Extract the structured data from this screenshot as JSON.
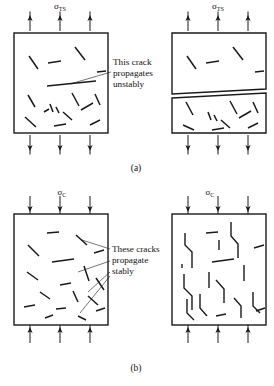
{
  "figure": {
    "background_color": "#ffffff",
    "line_color": "#1a1a1a"
  },
  "panels": [
    {
      "id": "a",
      "caption": "(a)",
      "caption_x": 136,
      "caption_y": 171,
      "stress_symbol": "σ",
      "stress_subscript": "TS",
      "stress_meaning": "tensile-stress",
      "load_direction": "tension",
      "specimens": [
        {
          "role": "before",
          "box": {
            "x": 14,
            "y": 33,
            "w": 94,
            "h": 100
          },
          "arrows_top": [
            30,
            60,
            90
          ],
          "arrows_bottom": [
            30,
            60,
            90
          ],
          "label_x": 60,
          "label_y": 9,
          "cracks": [
            [
              48,
              63,
              61,
              61
            ],
            [
              75,
              47,
              85,
              60
            ],
            [
              29,
              56,
              38,
              69
            ],
            [
              97,
              72,
              106,
              71
            ],
            [
              28,
              95,
              35,
              107
            ],
            [
              72,
              93,
              79,
              106
            ],
            [
              95,
              94,
              100,
              105
            ],
            [
              56,
              107,
              59,
              113
            ],
            [
              50,
              104,
              53,
              112
            ],
            [
              63,
              112,
              72,
              120
            ],
            [
              81,
              110,
              93,
              103
            ],
            [
              25,
              117,
              36,
              127
            ],
            [
              54,
              126,
              66,
              124
            ],
            [
              90,
              125,
              100,
              120
            ],
            [
              44,
              112,
              49,
              109
            ]
          ],
          "critical_crack": [
            47,
            86,
            96,
            81
          ]
        },
        {
          "role": "after",
          "box": {
            "x": 172,
            "y": 33,
            "w": 94,
            "h": 100
          },
          "arrows_top": [
            188,
            218,
            248
          ],
          "arrows_bottom": [
            188,
            218,
            248
          ],
          "label_x": 218,
          "label_y": 9,
          "fracture_path": [
            [
              172,
              96
            ],
            [
              266,
              91
            ]
          ],
          "fracture_gap": 4,
          "cracks": [
            [
              206,
              63,
              219,
              61
            ],
            [
              233,
              47,
              243,
              60
            ],
            [
              187,
              56,
              196,
              69
            ],
            [
              255,
              72,
              264,
              71
            ],
            [
              186,
              102,
              193,
              115
            ],
            [
              230,
              101,
              237,
              114
            ],
            [
              253,
              102,
              258,
              113
            ],
            [
              214,
              115,
              217,
              121
            ],
            [
              208,
              112,
              211,
              120
            ],
            [
              221,
              120,
              230,
              128
            ],
            [
              239,
              118,
              251,
              111
            ],
            [
              183,
              125,
              194,
              130
            ],
            [
              212,
              130,
              224,
              128
            ],
            [
              248,
              128,
              258,
              123
            ]
          ]
        }
      ],
      "annotation": {
        "lines": [
          "This crack",
          "propagates",
          "unstably"
        ],
        "x": 113,
        "y": 65,
        "line_height": 11,
        "leader_from": [
          111,
          72
        ],
        "leader_to": [
          70,
          84
        ]
      }
    },
    {
      "id": "b",
      "caption": "(b)",
      "caption_x": 136,
      "caption_y": 371,
      "stress_symbol": "σ",
      "stress_subscript": "C",
      "stress_meaning": "compressive-stress",
      "load_direction": "compression",
      "specimens": [
        {
          "role": "before",
          "box": {
            "x": 14,
            "y": 214,
            "w": 94,
            "h": 111
          },
          "arrows_top": [
            30,
            60,
            90
          ],
          "arrows_bottom": [
            30,
            60,
            90
          ],
          "label_x": 62,
          "label_y": 195,
          "cracks": [
            [
              47,
              233,
              59,
              232
            ],
            [
              76,
              235,
              87,
              245
            ],
            [
              28,
              245,
              39,
              256
            ],
            [
              94,
              253,
              104,
              250
            ],
            [
              52,
              262,
              74,
              259
            ],
            [
              84,
              266,
              89,
              281
            ],
            [
              27,
              272,
              38,
              280
            ],
            [
              60,
              285,
              71,
              283
            ],
            [
              96,
              278,
              104,
              290
            ],
            [
              40,
              292,
              50,
              299
            ],
            [
              73,
              291,
              78,
              302
            ],
            [
              88,
              296,
              98,
              305
            ],
            [
              24,
              307,
              35,
              305
            ],
            [
              56,
              309,
              66,
              308
            ],
            [
              96,
              311,
              105,
              308
            ],
            [
              45,
              318,
              53,
              315
            ],
            [
              78,
              316,
              86,
              320
            ]
          ]
        },
        {
          "role": "after",
          "box": {
            "x": 172,
            "y": 214,
            "w": 94,
            "h": 111
          },
          "arrows_top": [
            188,
            218,
            248
          ],
          "arrows_bottom": [
            188,
            218,
            248
          ],
          "label_x": 210,
          "label_y": 195,
          "branched_cracks": [
            [
              [
                185,
                233
              ],
              [
                185,
                245
              ],
              [
                192,
                252
              ],
              [
                192,
                268
              ]
            ],
            [
              [
                206,
                233
              ],
              [
                218,
                232
              ]
            ],
            [
              [
                231,
                222
              ],
              [
                231,
                236
              ],
              [
                238,
                244
              ],
              [
                238,
                258
              ]
            ],
            [
              [
                254,
                248
              ],
              [
                264,
                245
              ]
            ],
            [
              [
                182,
                264
              ],
              [
                182,
                268
              ]
            ],
            [
              [
                184,
                274
              ],
              [
                184,
                288
              ],
              [
                192,
                296
              ],
              [
                192,
                310
              ]
            ],
            [
              [
                212,
                262
              ],
              [
                234,
                259
              ]
            ],
            [
              [
                244,
                265
              ],
              [
                244,
                281
              ]
            ],
            [
              [
                209,
                272
              ],
              [
                209,
                288
              ]
            ],
            [
              [
                216,
                280
              ],
              [
                224,
                289
              ],
              [
                224,
                303
              ]
            ],
            [
              [
                200,
                294
              ],
              [
                200,
                308
              ],
              [
                207,
                316
              ]
            ],
            [
              [
                234,
                298
              ],
              [
                241,
                306
              ],
              [
                241,
                318
              ]
            ],
            [
              [
                253,
                292
              ],
              [
                253,
                306
              ],
              [
                260,
                313
              ]
            ],
            [
              [
                187,
                299
              ],
              [
                187,
                313
              ],
              [
                194,
                320
              ]
            ],
            [
              [
                216,
                316
              ],
              [
                226,
                314
              ]
            ],
            [
              [
                256,
                311
              ],
              [
                265,
                308
              ]
            ],
            [
              [
                219,
                240
              ],
              [
                219,
                250
              ]
            ]
          ]
        }
      ],
      "annotation": {
        "lines": [
          "These cracks",
          "propagate",
          "stably"
        ],
        "x": 112,
        "y": 252,
        "line_height": 11,
        "leaders": [
          {
            "from": [
              110,
              249
            ],
            "to": [
              82,
              240
            ]
          },
          {
            "from": [
              110,
              261
            ],
            "to": [
              78,
              272
            ]
          },
          {
            "from": [
              110,
              272
            ],
            "to": [
              88,
              292
            ]
          },
          {
            "from": [
              110,
              276
            ],
            "to": [
              80,
              313
            ]
          }
        ]
      }
    }
  ]
}
